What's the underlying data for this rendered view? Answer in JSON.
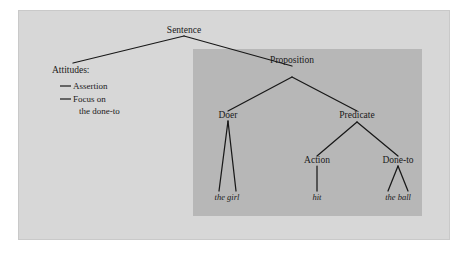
{
  "figure": {
    "background_color": "#d7d7d7",
    "shaded_region_color": "#b7b7b7",
    "line_color": "#181818",
    "page_color": "#ffffff"
  },
  "tree": {
    "root": {
      "label": "Sentence"
    },
    "nodes": [
      {
        "id": "sentence",
        "label": "Sentence",
        "style": "roman"
      },
      {
        "id": "proposition",
        "label": "Proposition",
        "style": "roman"
      },
      {
        "id": "doer",
        "label": "Doer",
        "style": "roman"
      },
      {
        "id": "predicate",
        "label": "Predicate",
        "style": "roman"
      },
      {
        "id": "action",
        "label": "Action",
        "style": "roman"
      },
      {
        "id": "done-to",
        "label": "Done-to",
        "style": "roman"
      }
    ],
    "leaves": [
      {
        "id": "the-girl",
        "label": "the girl",
        "style": "italic",
        "parent": "doer"
      },
      {
        "id": "hit",
        "label": "hit",
        "style": "italic",
        "parent": "action"
      },
      {
        "id": "the-ball",
        "label": "the ball",
        "style": "italic",
        "parent": "done-to"
      }
    ],
    "edges": [
      {
        "from": "sentence",
        "to": "attitudes"
      },
      {
        "from": "sentence",
        "to": "proposition"
      },
      {
        "from": "proposition",
        "to": "doer"
      },
      {
        "from": "proposition",
        "to": "predicate"
      },
      {
        "from": "predicate",
        "to": "action"
      },
      {
        "from": "predicate",
        "to": "done-to"
      },
      {
        "from": "doer",
        "to": "the-girl"
      },
      {
        "from": "action",
        "to": "hit"
      },
      {
        "from": "done-to",
        "to": "the-ball"
      }
    ]
  },
  "attitudes": {
    "heading": "Attitudes:",
    "items": [
      {
        "marker": "em-dash",
        "line1": "Assertion",
        "line2": ""
      },
      {
        "marker": "em-dash",
        "line1": "Focus on",
        "line2": "the done-to"
      }
    ]
  }
}
